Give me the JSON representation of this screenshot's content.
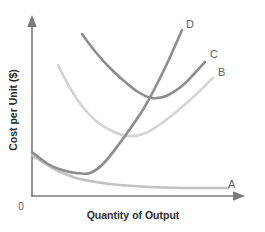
{
  "chart_data": {
    "type": "line",
    "title": "",
    "subtitle": "",
    "xlabel": "Quantity of Output",
    "ylabel": "Cost per Unit ($)",
    "origin_label": "0",
    "grid": false,
    "legend_position": "curve-end-labels",
    "axis_color": "#7a7a7a",
    "xlim": [
      0,
      100
    ],
    "ylim": [
      0,
      100
    ],
    "axis_ticks": {
      "x": [],
      "y": []
    },
    "annotations": [
      "Curves are unlabeled cost curves identified only by end letters A, B, C, D",
      "Curve A declines continuously and flattens near the horizontal axis",
      "Curves B and C are U-shaped",
      "Curve D declines briefly then rises steeply"
    ],
    "series": [
      {
        "name": "A",
        "label": "A",
        "color": "#c2c2c2",
        "shape": "declining-asymptotic",
        "label_x": 228,
        "label_y": 188,
        "x": [
          4,
          12,
          22,
          34,
          46,
          58,
          70,
          82,
          92,
          100
        ],
        "y": [
          30,
          23,
          17,
          12,
          9,
          6.5,
          5,
          4.2,
          4,
          4
        ],
        "points_px": [
          [
            32,
            155
          ],
          [
            44,
            163
          ],
          [
            58,
            171
          ],
          [
            76,
            178
          ],
          [
            96,
            182
          ],
          [
            120,
            185
          ],
          [
            150,
            187
          ],
          [
            180,
            188
          ],
          [
            205,
            188
          ],
          [
            228,
            188
          ]
        ]
      },
      {
        "name": "B",
        "label": "B",
        "color": "#d4d4d4",
        "shape": "u-shaped",
        "label_x": 218,
        "label_y": 76,
        "x": [
          16,
          24,
          34,
          44,
          54,
          62,
          70,
          80,
          90,
          98
        ],
        "y": [
          70,
          55,
          42,
          33,
          28,
          27,
          32,
          42,
          54,
          66
        ],
        "points_px": [
          [
            58,
            65
          ],
          [
            70,
            88
          ],
          [
            82,
            106
          ],
          [
            96,
            121
          ],
          [
            112,
            131
          ],
          [
            128,
            136
          ],
          [
            146,
            133
          ],
          [
            166,
            120
          ],
          [
            190,
            100
          ],
          [
            213,
            78
          ]
        ]
      },
      {
        "name": "C",
        "label": "C",
        "color": "#8d8d8c",
        "shape": "u-shaped",
        "label_x": 210,
        "label_y": 58,
        "x": [
          28,
          36,
          46,
          56,
          64,
          72,
          80,
          88,
          94,
          100
        ],
        "y": [
          86,
          74,
          63,
          55,
          51,
          50,
          53,
          59,
          66,
          74
        ],
        "points_px": [
          [
            82,
            34
          ],
          [
            94,
            50
          ],
          [
            108,
            66
          ],
          [
            124,
            81
          ],
          [
            138,
            92
          ],
          [
            152,
            98
          ],
          [
            166,
            96
          ],
          [
            182,
            86
          ],
          [
            194,
            74
          ],
          [
            205,
            62
          ]
        ]
      },
      {
        "name": "D",
        "label": "D",
        "color": "#8d8d8c",
        "shape": "declining-then-steeply-rising",
        "label_x": 186,
        "label_y": 28,
        "x": [
          4,
          10,
          16,
          22,
          28,
          34,
          42,
          52,
          62,
          72
        ],
        "y": [
          33,
          22,
          15,
          11,
          10,
          16,
          30,
          48,
          68,
          88
        ],
        "points_px": [
          [
            32,
            152
          ],
          [
            48,
            164
          ],
          [
            62,
            170
          ],
          [
            76,
            173
          ],
          [
            90,
            173
          ],
          [
            104,
            163
          ],
          [
            122,
            140
          ],
          [
            144,
            108
          ],
          [
            164,
            70
          ],
          [
            182,
            30
          ]
        ]
      }
    ]
  },
  "labels": {
    "curve_a": "A",
    "curve_b": "B",
    "curve_c": "C",
    "curve_d": "D",
    "x_axis_title": "Quantity of Output",
    "y_axis_title": "Cost per Unit ($)",
    "origin": "0"
  }
}
